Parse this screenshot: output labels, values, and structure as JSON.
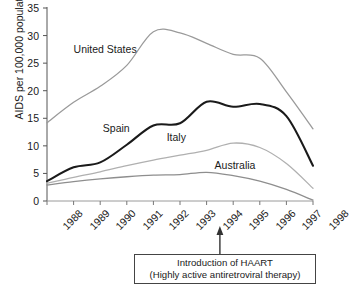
{
  "chart_data": {
    "type": "line",
    "title": "",
    "xlabel": "",
    "ylabel": "AIDS per 100,000 population",
    "x": [
      1988,
      1989,
      1990,
      1991,
      1992,
      1993,
      1994,
      1995,
      1996,
      1997,
      1998
    ],
    "xtick_labels": [
      "1988",
      "1989",
      "1990",
      "1991",
      "1992",
      "1993",
      "1994",
      "1995",
      "1996",
      "1997",
      "1998"
    ],
    "ytick_labels": [
      "0",
      "5",
      "10",
      "15",
      "20",
      "25",
      "30",
      "35"
    ],
    "yticks": [
      0,
      5,
      10,
      15,
      20,
      25,
      30,
      35
    ],
    "ylim": [
      0,
      35
    ],
    "xlim": [
      1988,
      1998
    ],
    "grid": false,
    "legend": "inline-labels",
    "series": [
      {
        "name": "United States",
        "color": "#9a9a9a",
        "width": 1.3,
        "label_x": 1989.0,
        "label_y": 27.6,
        "values": [
          14.2,
          17.9,
          20.8,
          24.6,
          30.7,
          30.5,
          28.6,
          26.6,
          25.9,
          19.8,
          13.1
        ]
      },
      {
        "name": "Spain",
        "color": "#1a1a1a",
        "width": 2.1,
        "label_x": 1990.1,
        "label_y": 13.3,
        "values": [
          3.6,
          6.1,
          7.0,
          10.2,
          13.7,
          14.1,
          18.0,
          17.1,
          17.6,
          15.4,
          6.4
        ]
      },
      {
        "name": "Italy",
        "color": "#b0b0b0",
        "width": 1.3,
        "label_x": 1992.5,
        "label_y": 11.6,
        "values": [
          3.2,
          4.3,
          5.3,
          6.4,
          7.4,
          8.3,
          9.2,
          10.5,
          9.7,
          6.8,
          2.3
        ]
      },
      {
        "name": "Australia",
        "color": "#8e8e8e",
        "width": 1.3,
        "label_x": 1994.3,
        "label_y": 6.6,
        "values": [
          2.9,
          3.5,
          4.0,
          4.4,
          4.7,
          4.8,
          5.2,
          4.6,
          3.6,
          2.1,
          0.15
        ]
      }
    ],
    "annotation": {
      "line1": "Introduction of HAART",
      "line2": "(Highly active antiretroviral therapy)",
      "arrow_x": 1994.5,
      "arrow": "up-arrow"
    }
  }
}
